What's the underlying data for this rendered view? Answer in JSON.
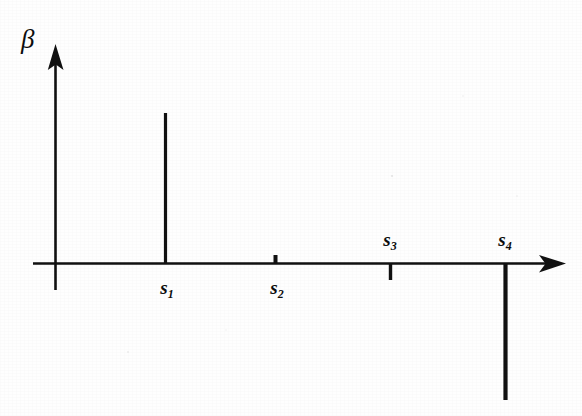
{
  "figure": {
    "background_color": "#fefefe",
    "ink_color": "#111111",
    "width": 582,
    "height": 416
  },
  "axes": {
    "y_axis_label": "β",
    "x_axis_label": "",
    "y_axis_name": "beta-axis",
    "x_axis_name": "s-axis",
    "origin": {
      "x": 55,
      "y": 263
    },
    "x_axis_start_x": 33,
    "x_axis_arrow_tip_x": 565,
    "y_axis_arrow_tip_y": 45,
    "y_axis_bottom_y": 290
  },
  "chart_data": {
    "type": "bar",
    "title": "",
    "subtitle": "",
    "xlabel": "",
    "ylabel": "β",
    "categories": [
      "s1",
      "s2",
      "s3",
      "s4"
    ],
    "tick_labels": [
      "s",
      "s",
      "s",
      "s"
    ],
    "tick_subscripts": [
      "1",
      "2",
      "3",
      "4"
    ],
    "values": [
      150,
      8,
      -17,
      -137
    ],
    "value_units": "pixels",
    "x_positions": [
      165,
      275,
      390,
      505
    ],
    "label_positions": [
      "below",
      "below",
      "above",
      "above"
    ],
    "axis_baseline_y": 263,
    "xlim": [
      33,
      565
    ],
    "ylim": [
      -153,
      218
    ],
    "grid": false,
    "legend": null
  },
  "stems": [
    {
      "name": "stem-s1",
      "label": "s",
      "subscript": "1",
      "x": 165,
      "value": 150,
      "direction": "up",
      "thickness": 3.2,
      "label_side": "below",
      "label_x": 167,
      "label_y": 278
    },
    {
      "name": "stem-s2",
      "label": "s",
      "subscript": "2",
      "x": 275,
      "value": 8,
      "direction": "up",
      "thickness": 4.0,
      "label_side": "below",
      "label_x": 277,
      "label_y": 278
    },
    {
      "name": "stem-s3",
      "label": "s",
      "subscript": "3",
      "x": 390,
      "value": -17,
      "direction": "down",
      "thickness": 3.4,
      "label_side": "above",
      "label_x": 390,
      "label_y": 230
    },
    {
      "name": "stem-s4",
      "label": "s",
      "subscript": "4",
      "x": 505,
      "value": -137,
      "direction": "down",
      "thickness": 4.2,
      "label_side": "above",
      "label_x": 505,
      "label_y": 230
    }
  ]
}
